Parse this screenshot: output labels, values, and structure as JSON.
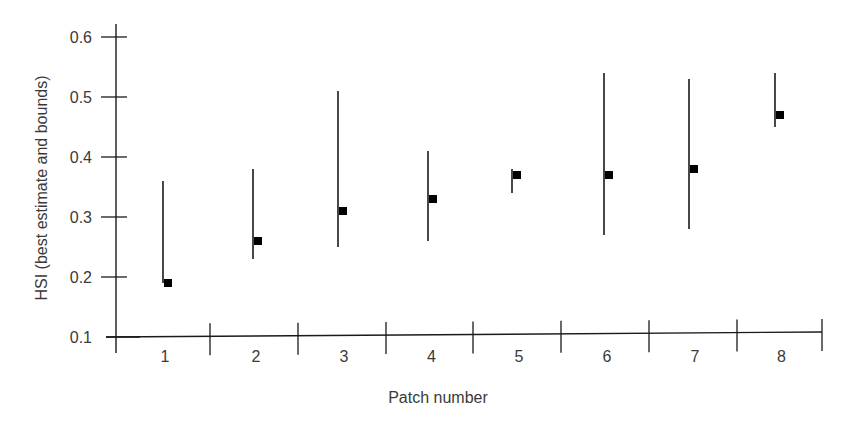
{
  "chart_data": {
    "type": "errorbar",
    "title": "",
    "xlabel": "Patch number",
    "ylabel": "HSI (best estimate and bounds)",
    "categories": [
      "1",
      "2",
      "3",
      "4",
      "5",
      "6",
      "7",
      "8"
    ],
    "ylim": [
      0.1,
      0.6
    ],
    "yticks": [
      "0.1",
      "0.2",
      "0.3",
      "0.4",
      "0.5",
      "0.6"
    ],
    "grid": false,
    "legend": null,
    "series": [
      {
        "name": "Best estimate",
        "values": [
          0.19,
          0.26,
          0.31,
          0.33,
          0.37,
          0.37,
          0.38,
          0.47
        ]
      },
      {
        "name": "Upper bound",
        "values": [
          0.36,
          0.38,
          0.51,
          0.41,
          0.38,
          0.54,
          0.53,
          0.54
        ]
      },
      {
        "name": "Lower bound",
        "values": [
          0.19,
          0.23,
          0.25,
          0.26,
          0.34,
          0.27,
          0.28,
          0.45
        ]
      }
    ]
  },
  "axes": {
    "x_title": "Patch number",
    "y_title": "HSI (best estimate and bounds)"
  },
  "colors": {
    "ink": "#1a1a1a",
    "text": "#3a3a3a"
  }
}
